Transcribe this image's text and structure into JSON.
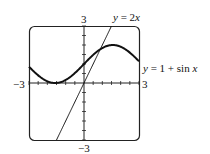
{
  "chart_data": {
    "type": "line",
    "title": "",
    "xlabel": "",
    "ylabel": "",
    "xlim": [
      -3,
      3
    ],
    "ylim": [
      -3,
      3
    ],
    "grid": false,
    "ticks": {
      "x_step": 0.5,
      "y_step": 0.5
    },
    "tick_labels": {
      "x_min": "−3",
      "x_max": "3",
      "y_min": "−3",
      "y_max": "3"
    },
    "series": [
      {
        "name": "y = 2x",
        "label_prefix": "y = 2",
        "label_var": "x",
        "function": "2x",
        "x": [
          -1.5,
          -1,
          -0.5,
          0,
          0.5,
          1,
          1.5
        ],
        "y": [
          -3,
          -2,
          -1,
          0,
          1,
          2,
          3
        ]
      },
      {
        "name": "y = 1 + sin x",
        "label_prefix": "y = 1 + sin ",
        "label_var": "x",
        "function": "1+sin(x)",
        "x": [
          -3,
          -2,
          -1.5708,
          -1,
          0,
          1,
          1.5708,
          2,
          3
        ],
        "y": [
          0.86,
          0.09,
          0,
          0.16,
          1,
          1.84,
          2,
          1.91,
          1.14
        ]
      }
    ]
  }
}
